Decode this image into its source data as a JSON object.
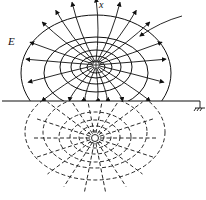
{
  "diagram": {
    "type": "method-of-images field plot",
    "labels": {
      "field": "E",
      "axis": "x"
    },
    "real_charge": {
      "sign": "+",
      "symbol": "⊕",
      "x": 96,
      "y": 65
    },
    "image_charge": {
      "sign": "-",
      "symbol": "○",
      "x": 95,
      "y": 138
    },
    "ground_plane": {
      "y": 101,
      "x_start": 2,
      "x_end": 200
    },
    "ground_symbol": {
      "x": 200,
      "y": 101
    },
    "colors": {
      "stroke": "#111111",
      "background": "#ffffff"
    }
  }
}
